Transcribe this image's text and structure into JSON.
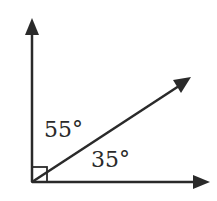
{
  "diagram": {
    "type": "angle-diagram",
    "angles": [
      {
        "label": "55°",
        "position": "upper",
        "value": 55
      },
      {
        "label": "35°",
        "position": "lower",
        "value": 35
      }
    ],
    "right_angle_marker": true,
    "rays": [
      "vertical-up",
      "diagonal",
      "horizontal-right"
    ],
    "color": "#2a2a2a"
  }
}
